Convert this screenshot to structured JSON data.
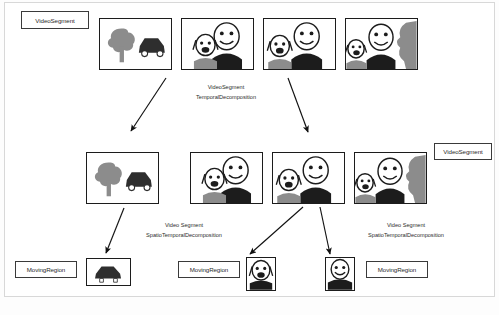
{
  "diagram": {
    "colors": {
      "frame_border": "#1c1c1c",
      "label_border": "#3a3a3a",
      "arrow": "#111111",
      "page_border": "#d8d8d8",
      "fill_dark": "#2e2e2e",
      "fill_mid": "#8c8c8c",
      "fill_light": "#bfbfbf",
      "background": "#ffffff"
    }
  },
  "labels": {
    "video_segment_top": "VideoSegment",
    "video_segment_right": "VideoSegment",
    "moving_region_left": "MovingRegion",
    "moving_region_middle": "MovingRegion",
    "moving_region_right": "MovingRegion"
  },
  "captions": {
    "temporal_decomposition": {
      "line1": "VideoSegment",
      "line2": "TemporalDecomposition"
    },
    "spatio_temporal_left": {
      "line1": "Video Segment",
      "line2": "SpatioTemporalDecomposition"
    },
    "spatio_temporal_right": {
      "line1": "Video Segment",
      "line2": "SpatioTemporalDecomposition"
    }
  },
  "top_row_frames": [
    {
      "id": "frame-tree-car",
      "content": "tree-and-car-scene"
    },
    {
      "id": "frame-two-people-a",
      "content": "two-people-scene"
    },
    {
      "id": "frame-two-people-b",
      "content": "two-people-scene"
    },
    {
      "id": "frame-two-people-shadow",
      "content": "two-people-with-shadow-scene"
    }
  ],
  "middle_row_frames": [
    {
      "id": "frame-tree-car-2",
      "content": "tree-and-car-scene"
    },
    {
      "id": "frame-two-people-c",
      "content": "two-people-scene"
    },
    {
      "id": "frame-two-people-d",
      "content": "two-people-scene"
    },
    {
      "id": "frame-two-people-shadow-2",
      "content": "two-people-with-shadow-scene"
    }
  ],
  "bottom_thumbs": [
    {
      "id": "thumb-car",
      "content": "car-region"
    },
    {
      "id": "thumb-person-open-mouth",
      "content": "person-open-mouth-region"
    },
    {
      "id": "thumb-person-smile",
      "content": "person-smile-region"
    }
  ],
  "figure": {
    "caption": ""
  }
}
